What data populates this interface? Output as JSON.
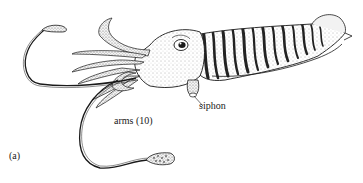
{
  "figure": {
    "panel_label": "(a)",
    "labels": {
      "siphon": "siphon",
      "arms": "arms (10)"
    },
    "colors": {
      "background": "#ffffff",
      "ink": "#1a1a1a",
      "stipple": "#555555",
      "stripe": "#222222"
    }
  }
}
